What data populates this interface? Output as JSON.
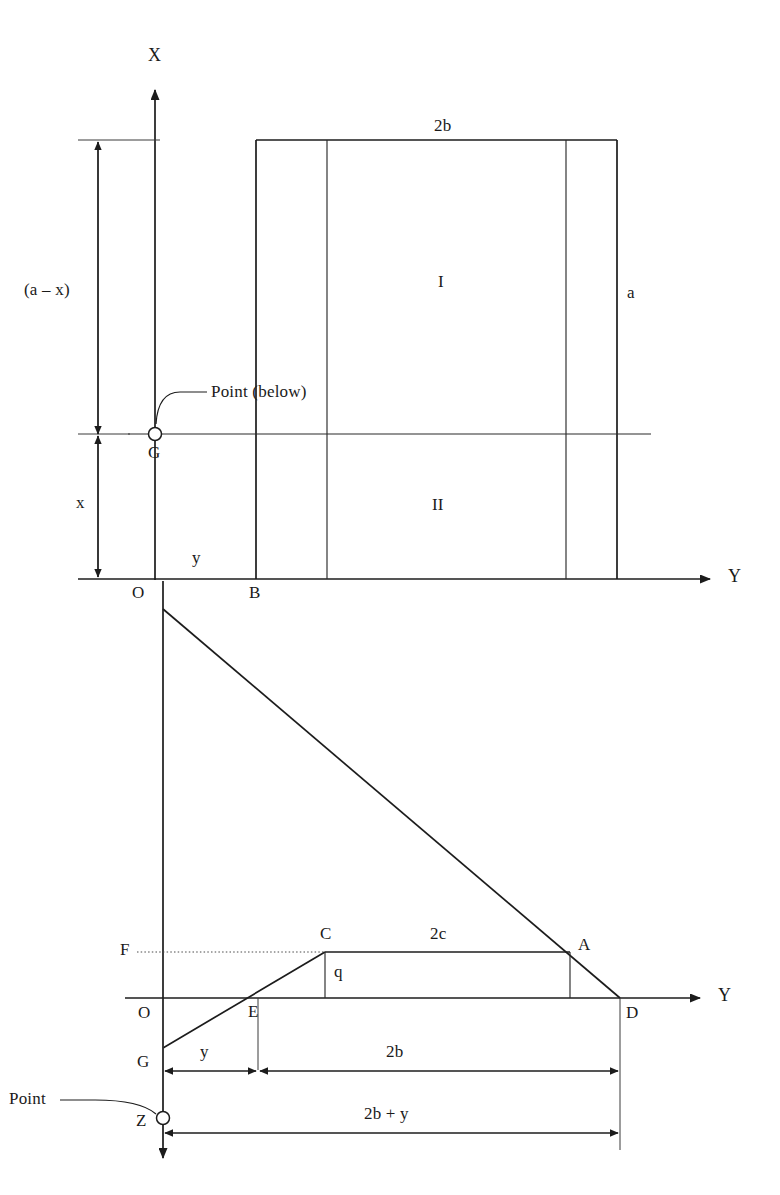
{
  "figure": {
    "title_fragment": "",
    "background_color": "#ffffff",
    "line_color": "#1c1c1c",
    "width": 780,
    "height": 1195
  },
  "upper_diagram": {
    "name": "cross-section-plan-view",
    "axes": {
      "vertical_label": "X",
      "horizontal_label": "Y",
      "origin_label": "O"
    },
    "dimensions": {
      "top_width": "2b",
      "right_height": "a",
      "upper_left_vertical": "(a – x)",
      "lower_left_vertical": "x",
      "horizontal_offset": "y"
    },
    "region_labels": {
      "upper": "I",
      "lower": "II"
    },
    "points": {
      "centroid": "G",
      "base_corner": "B"
    },
    "annotation": {
      "text": "Point (below)",
      "target": "G"
    }
  },
  "lower_diagram": {
    "name": "stress-distribution-view",
    "axes": {
      "horizontal_label": "Y",
      "origin_label": "O"
    },
    "points": {
      "left_upper": "F",
      "trapezoid_top_left": "C",
      "trapezoid_top_right": "A",
      "baseline_left": "E",
      "baseline_right": "D",
      "lower_origin": "G",
      "apex": "Z"
    },
    "dimensions": {
      "top_segment": "2c",
      "vertical_segment": "q",
      "left_offset": "y",
      "main_width": "2b",
      "total_width": "2b + y"
    },
    "annotation": {
      "text": "Point",
      "target": "Z"
    }
  },
  "icons": {
    "arrow_head": "arrowhead-icon",
    "point_marker": "circle-point-marker-icon"
  }
}
